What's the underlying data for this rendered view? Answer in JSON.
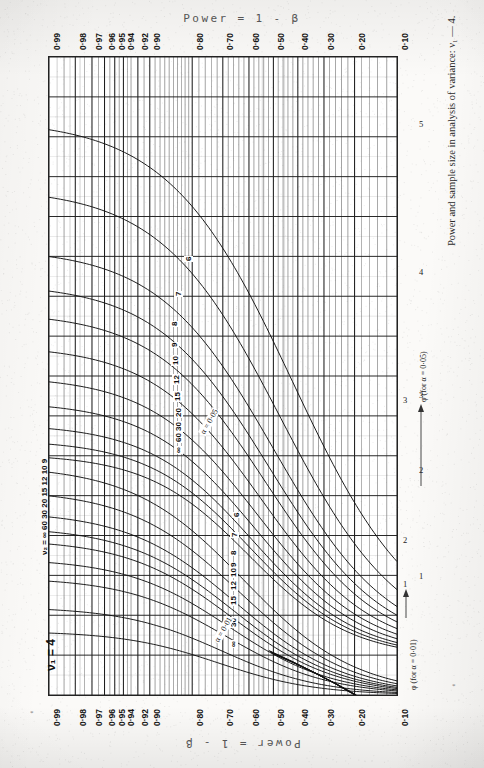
{
  "titles": {
    "top": "Power = 1 - β",
    "bottom": "Power = 1 - β",
    "caption": "Power and sample size in analysis of variance: ν₁  — 4.",
    "page_mark": "*",
    "page_mark2": "*"
  },
  "annotations": {
    "nu2_series": "ν₂ = ∞ 60 30 20 15 12 10 9",
    "nu1_label": "ν₁ = 4",
    "alpha05": "α = 0·05",
    "alpha01": "α = 0·01",
    "phi05_label": "φ (for α = 0·05)",
    "phi01_label": "φ (for α = 0·01)"
  },
  "chart_data": {
    "type": "line",
    "title": "Power = 1 - β",
    "subtitle": "Power and sample size in analysis of variance: ν₁ = 4.",
    "orientation": "rotated-90-clockwise",
    "xlabel": "Power = 1 - β",
    "ylabel": "φ",
    "grid": true,
    "legend": "inline curve labels",
    "power_axis": {
      "name": "Power = 1 - β",
      "scale": "probit (normal probability)",
      "major_ticks": [
        "0·99",
        "0·98",
        "0·97",
        "0·96",
        "0·95",
        "0·94",
        "0·92",
        "0·90",
        "0·80",
        "0·70",
        "0·60",
        "0·50",
        "0·40",
        "0·30",
        "0·20",
        "0·10"
      ],
      "major_values": [
        0.99,
        0.98,
        0.97,
        0.96,
        0.95,
        0.94,
        0.92,
        0.9,
        0.8,
        0.7,
        0.6,
        0.5,
        0.4,
        0.3,
        0.2,
        0.1
      ],
      "minor_values": [
        0.995,
        0.985,
        0.975,
        0.965,
        0.955,
        0.945,
        0.935,
        0.93,
        0.91,
        0.89,
        0.88,
        0.87,
        0.86,
        0.85,
        0.84,
        0.83,
        0.82,
        0.81,
        0.78,
        0.76,
        0.74,
        0.72,
        0.68,
        0.66,
        0.64,
        0.62,
        0.58,
        0.56,
        0.54,
        0.52,
        0.48,
        0.46,
        0.44,
        0.42,
        0.38,
        0.36,
        0.34,
        0.32,
        0.28,
        0.26,
        0.24,
        0.22,
        0.18,
        0.16,
        0.14,
        0.12
      ]
    },
    "phi_axes": [
      {
        "name": "φ (for α = 0·05)",
        "ticks": [
          1,
          2,
          3,
          4,
          5
        ],
        "visible_tick_labels": [
          "1",
          "2",
          "3",
          "4",
          "5"
        ],
        "range": [
          1,
          5
        ]
      },
      {
        "name": "φ (for α = 0·01)",
        "ticks": [
          1,
          2,
          3
        ],
        "visible_tick_labels": [
          "1",
          "2",
          "3"
        ],
        "range": [
          1,
          3
        ]
      }
    ],
    "families": [
      {
        "alpha": 0.05,
        "label": "α = 0·05",
        "curve_labels": [
          "6",
          "7",
          "8",
          "9",
          "10",
          "12",
          "15",
          "20",
          "30",
          "60",
          "∞"
        ],
        "series": [
          {
            "name": "ν₂ = 6",
            "nu2": 6
          },
          {
            "name": "ν₂ = 7",
            "nu2": 7
          },
          {
            "name": "ν₂ = 8",
            "nu2": 8
          },
          {
            "name": "ν₂ = 9",
            "nu2": 9
          },
          {
            "name": "ν₂ = 10",
            "nu2": 10
          },
          {
            "name": "ν₂ = 12",
            "nu2": 12
          },
          {
            "name": "ν₂ = 15",
            "nu2": 15
          },
          {
            "name": "ν₂ = 20",
            "nu2": 20
          },
          {
            "name": "ν₂ = 30",
            "nu2": 30
          },
          {
            "name": "ν₂ = 60",
            "nu2": 60
          },
          {
            "name": "ν₂ = ∞",
            "nu2": 99999
          }
        ]
      },
      {
        "alpha": 0.01,
        "label": "α = 0·01",
        "curve_labels": [
          "6",
          "7",
          "8",
          "9",
          "10",
          "12",
          "15",
          "30",
          "∞"
        ],
        "series": [
          {
            "name": "ν₂ = 6",
            "nu2": 6
          },
          {
            "name": "ν₂ = 7",
            "nu2": 7
          },
          {
            "name": "ν₂ = 8",
            "nu2": 8
          },
          {
            "name": "ν₂ = 9",
            "nu2": 9
          },
          {
            "name": "ν₂ = 10",
            "nu2": 10
          },
          {
            "name": "ν₂ = 12",
            "nu2": 12
          },
          {
            "name": "ν₂ = 15",
            "nu2": 15
          },
          {
            "name": "ν₂ = 30",
            "nu2": 30
          },
          {
            "name": "ν₂ = ∞",
            "nu2": 99999
          }
        ]
      }
    ],
    "colors": {
      "ink": "#1a1a1a",
      "grid": "#555555",
      "paper": "#fdfdfb"
    }
  }
}
